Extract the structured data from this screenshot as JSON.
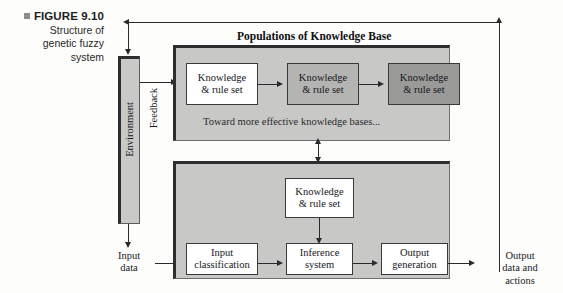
{
  "figure": {
    "number": "FIGURE 9.10",
    "caption_lines": [
      "Structure of",
      "genetic fuzzy",
      "system"
    ],
    "bullet_color": "#8d8d8d"
  },
  "environment": {
    "label": "Environment"
  },
  "flow_labels": {
    "feedback": "Feedback",
    "input_line1": "Input",
    "input_line2": "data",
    "output_line1": "Output",
    "output_line2": "data and",
    "output_line3": "actions"
  },
  "top_panel": {
    "title": "Populations of Knowledge Base",
    "note": "Toward more effective knowledge bases...",
    "boxes": [
      {
        "line1": "Knowledge",
        "line2": "& rule set",
        "shade": "shade1",
        "fill": "#ffffff"
      },
      {
        "line1": "Knowledge",
        "line2": "& rule set",
        "shade": "shade2",
        "fill": "#b4b4b2"
      },
      {
        "line1": "Knowledge",
        "line2": "& rule set",
        "shade": "shade3",
        "fill": "#9a9a98"
      }
    ]
  },
  "bottom_panel": {
    "knowledge_box": {
      "line1": "Knowledge",
      "line2": "& rule set"
    },
    "boxes": [
      {
        "line1": "Input",
        "line2": "classification"
      },
      {
        "line1": "Inference",
        "line2": "system"
      },
      {
        "line1": "Output",
        "line2": "generation"
      }
    ]
  },
  "colors": {
    "panel_fill": "#c8c8c6",
    "panel_shadow": "#2e2e2e",
    "line": "#2a2a2d",
    "page_bg": "#fdfdfc"
  }
}
